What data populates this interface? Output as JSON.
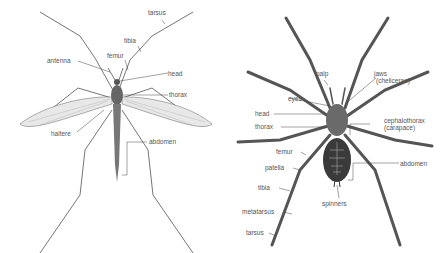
{
  "crane_fly": {
    "labels": {
      "tarsus": "tarsus",
      "tibia": "tibia",
      "antenna": "antenna",
      "femur": "femur",
      "head": "head",
      "thorax": "thorax",
      "haltere": "haltere",
      "abdomen": "abdomen"
    }
  },
  "spider": {
    "labels": {
      "palp": "palp",
      "jaws": "jaws",
      "jaws_sub": "(chelicerae)",
      "eyes": "eyes",
      "head": "head",
      "thorax": "thorax",
      "cephalothorax": "cephalothorax",
      "cephalothorax_sub": "(carapace)",
      "femur": "femur",
      "abdomen": "abdomen",
      "patella": "patella",
      "tibia": "tibia",
      "spinners": "spinners",
      "metatarsus": "metatarsus",
      "tarsus": "tarsus"
    }
  }
}
